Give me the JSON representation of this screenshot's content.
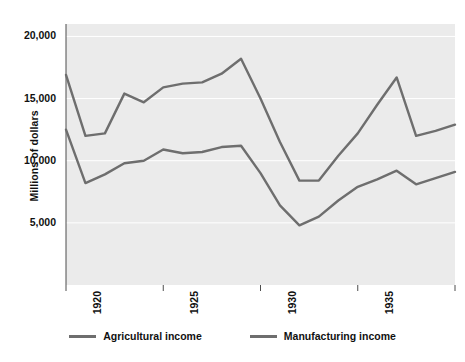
{
  "chart_data": {
    "type": "line",
    "title": "",
    "xlabel": "",
    "ylabel": "Millions of dollars",
    "xlim": [
      1920,
      1940
    ],
    "ylim": [
      0,
      21000
    ],
    "grid": true,
    "grid_axis": "y",
    "legend_position": "bottom",
    "plot_background": "#ebebeb",
    "x": [
      1920,
      1921,
      1922,
      1923,
      1924,
      1925,
      1926,
      1927,
      1928,
      1929,
      1930,
      1931,
      1932,
      1933,
      1934,
      1935,
      1936,
      1937,
      1938,
      1939,
      1940
    ],
    "yticks": [
      5000,
      10000,
      15000,
      20000
    ],
    "ytick_labels": [
      "5,000",
      "10,000",
      "15,000",
      "20,000"
    ],
    "xticks": [
      1920,
      1925,
      1930,
      1935,
      1940
    ],
    "xtick_labels": [
      "1920",
      "1925",
      "1930",
      "1935",
      "1940"
    ],
    "series": [
      {
        "name": "Agricultural income",
        "color": "#6e6e6e",
        "values": [
          12500,
          8200,
          8900,
          9800,
          10000,
          10900,
          10600,
          10700,
          11100,
          11200,
          9000,
          6400,
          4800,
          5500,
          6800,
          7900,
          8500,
          9200,
          8100,
          8600,
          9100
        ]
      },
      {
        "name": "Manufacturing income",
        "color": "#6e6e6e",
        "values": [
          16900,
          12000,
          12200,
          15400,
          14700,
          15900,
          16200,
          16300,
          17000,
          18200,
          15000,
          11500,
          8400,
          8400,
          10400,
          12200,
          14500,
          16700,
          12000,
          12400,
          12900
        ]
      }
    ]
  },
  "legend": {
    "entries": [
      {
        "label": "Agricultural income"
      },
      {
        "label": "Manufacturing income"
      }
    ]
  },
  "axis": {
    "y_title": "Millions of dollars"
  }
}
